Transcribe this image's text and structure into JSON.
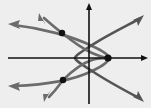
{
  "figure": {
    "background_color": "#eeeeee",
    "axis_color": "#111111",
    "curve_color": "#6b6b6b",
    "point_color": "#111111",
    "width": 151,
    "height": 108
  },
  "chart_data": {
    "type": "scatter",
    "title": "",
    "subtitle": "",
    "xlabel": "",
    "ylabel": "",
    "grid": false,
    "legend": null,
    "axis_ranges": {
      "x_axis_pixels": [
        8,
        147
      ],
      "y_axis_pixels": [
        4,
        104
      ],
      "origin_pixels": [
        89,
        58
      ]
    },
    "axes": [
      {
        "name": "x-axis",
        "orientation": "horizontal",
        "arrow": "right",
        "tick_labels": []
      },
      {
        "name": "y-axis",
        "orientation": "vertical",
        "arrow": "up",
        "tick_labels": []
      }
    ],
    "series": [
      {
        "name": "left-opening parabola",
        "shape": "parabola",
        "opens": "left",
        "vertex_pixels": [
          109,
          58
        ],
        "arrow_ends_pixels": [
          [
            9,
            25
          ],
          [
            9,
            86
          ]
        ]
      },
      {
        "name": "right-opening parabola",
        "shape": "parabola",
        "opens": "right",
        "vertex_pixels": [
          75,
          58
        ],
        "arrow_ends_pixels": [
          [
            143,
            16
          ],
          [
            143,
            100
          ]
        ]
      },
      {
        "name": "upper-left branch arrow",
        "shape": "arrow",
        "arrow_ends_pixels": [
          [
            40,
            14
          ]
        ]
      },
      {
        "name": "lower-left branch arrow",
        "shape": "arrow",
        "arrow_ends_pixels": [
          [
            45,
            101
          ]
        ]
      }
    ],
    "intersection_points": [
      {
        "label": "upper-left intersection",
        "pixels": [
          62,
          33
        ]
      },
      {
        "label": "lower-left intersection",
        "pixels": [
          63,
          80
        ]
      },
      {
        "label": "right intersection on x-axis",
        "pixels": [
          108,
          58
        ]
      }
    ],
    "point_count": 3
  }
}
